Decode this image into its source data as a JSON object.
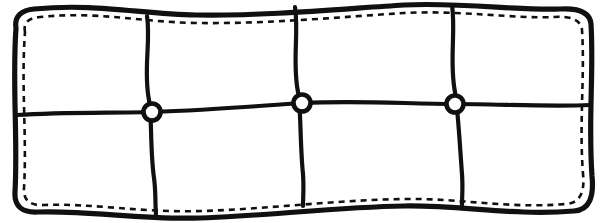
{
  "figure": {
    "width": 606,
    "height": 223,
    "background_color": "#ffffff",
    "ink_color": "#101010"
  },
  "chart_data": {
    "type": "diagram",
    "grid": {
      "columns": 4,
      "rows": 2,
      "panel_count": 8
    },
    "outer_border": {
      "style": "solid",
      "stroke_width": 5.2,
      "color": "#101010",
      "edge_shape": "wavy",
      "path": "M 16 28 C 14 16 22 10 34 9 C 96 3 140 14 196 15 C 268 16 340 9 404 5 C 462 2 520 11 560 9 C 578 8 590 12 591 24 C 594 72 588 120 592 176 C 594 196 590 210 574 211 C 512 216 462 205 404 206 C 336 207 266 216 200 218 C 142 220 86 210 38 212 C 22 213 14 206 15 192 C 18 140 12 82 16 28 Z"
    },
    "stitching": {
      "style": "dashed",
      "stroke_width": 2.6,
      "dash_pattern": "6 5",
      "color": "#101010",
      "offset_from_border": 6,
      "path": "M 25 32 C 23 22 29 18 40 17 C 98 11 140 22 196 23 C 268 24 340 17 404 13 C 460 10 516 19 554 17 C 569 16 581 19 582 30 C 585 76 579 121 583 174 C 585 192 580 203 566 204 C 508 209 460 198 404 199 C 336 200 268 209 202 211 C 144 213 90 203 44 205 C 30 206 23 200 24 188 C 27 138 21 84 25 32 Z"
    },
    "vertical_dividers": [
      {
        "id": "divider-v1",
        "top_x": 147,
        "top_y": 17,
        "bottom_x": 156,
        "bottom_y": 213,
        "path": "M 147 16 C 151 42 143 70 149 100 C 152 116 150 150 154 178 C 156 192 155 204 156 214"
      },
      {
        "id": "divider-v2",
        "top_x": 295,
        "top_y": 7,
        "bottom_x": 303,
        "bottom_y": 205,
        "path": "M 295 7 C 299 34 292 62 298 92 C 301 108 300 146 303 174 C 304 188 303 198 303 206"
      },
      {
        "id": "divider-v3",
        "top_x": 452,
        "top_y": 5,
        "bottom_x": 462,
        "bottom_y": 204,
        "path": "M 452 5 C 456 32 449 62 455 92 C 458 110 460 148 462 174 C 463 188 462 197 462 205"
      }
    ],
    "horizontal_dividers": [
      {
        "id": "divider-h1",
        "left_x": 16,
        "left_y": 114,
        "right_x": 591,
        "right_y": 106,
        "path": "M 17 115 C 60 112 110 113 152 112 C 210 110 256 106 302 103 C 360 100 408 104 455 104 C 500 104 548 107 590 105"
      }
    ],
    "nodes": [
      {
        "id": "node-1",
        "cx": 152,
        "cy": 112,
        "radius": 8.5,
        "fill": "#ffffff",
        "stroke": "#101010"
      },
      {
        "id": "node-2",
        "cx": 302,
        "cy": 103,
        "radius": 8.5,
        "fill": "#ffffff",
        "stroke": "#101010"
      },
      {
        "id": "node-3",
        "cx": 455,
        "cy": 104,
        "radius": 8.5,
        "fill": "#ffffff",
        "stroke": "#101010"
      }
    ],
    "panels": [
      {
        "id": "panel-top-1",
        "row": "top",
        "column": 1
      },
      {
        "id": "panel-top-2",
        "row": "top",
        "column": 2
      },
      {
        "id": "panel-top-3",
        "row": "top",
        "column": 3
      },
      {
        "id": "panel-top-4",
        "row": "top",
        "column": 4
      },
      {
        "id": "panel-bottom-1",
        "row": "bottom",
        "column": 1
      },
      {
        "id": "panel-bottom-2",
        "row": "bottom",
        "column": 2
      },
      {
        "id": "panel-bottom-3",
        "row": "bottom",
        "column": 3
      },
      {
        "id": "panel-bottom-4",
        "row": "bottom",
        "column": 4
      }
    ],
    "labels": [],
    "legend": []
  }
}
